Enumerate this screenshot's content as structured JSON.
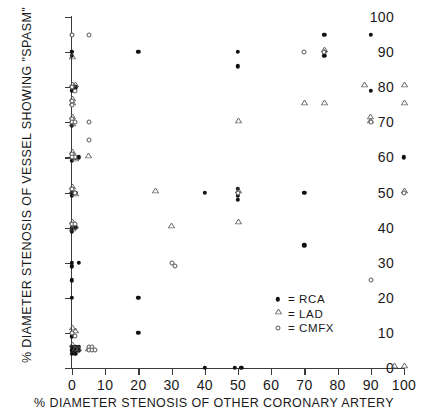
{
  "chart_data": {
    "type": "scatter",
    "title": "",
    "xlabel": "% DIAMETER STENOSIS OF OTHER CORONARY ARTERY",
    "ylabel": "% DIAMETER STENOSIS OF VESSEL SHOWING \"SPASM\"",
    "xlim": [
      0,
      100
    ],
    "ylim": [
      0,
      100
    ],
    "xticks": [
      0,
      10,
      20,
      30,
      40,
      50,
      60,
      70,
      80,
      90,
      100
    ],
    "yticks": [
      0,
      10,
      20,
      30,
      40,
      50,
      60,
      70,
      80,
      90,
      100
    ],
    "grid": false,
    "legend_position": "lower-right",
    "series": [
      {
        "name": "RCA",
        "marker": "filled-circle",
        "color": "#101010",
        "points": [
          [
            0,
            95
          ],
          [
            0,
            90
          ],
          [
            0,
            90
          ],
          [
            0,
            89
          ],
          [
            0,
            80
          ],
          [
            1,
            80
          ],
          [
            0,
            79
          ],
          [
            0,
            70
          ],
          [
            0,
            69
          ],
          [
            0,
            61
          ],
          [
            1,
            60
          ],
          [
            0,
            59
          ],
          [
            2,
            60
          ],
          [
            0,
            51
          ],
          [
            0,
            50
          ],
          [
            1,
            50
          ],
          [
            0,
            49
          ],
          [
            0,
            41
          ],
          [
            1,
            40
          ],
          [
            0,
            40
          ],
          [
            0,
            39
          ],
          [
            0,
            30
          ],
          [
            2,
            30
          ],
          [
            0,
            29
          ],
          [
            0,
            25
          ],
          [
            0,
            20
          ],
          [
            0,
            10
          ],
          [
            0,
            9
          ],
          [
            0,
            6
          ],
          [
            1,
            6
          ],
          [
            2,
            6
          ],
          [
            0,
            5
          ],
          [
            1,
            5
          ],
          [
            2,
            5
          ],
          [
            1,
            4
          ],
          [
            0,
            4
          ],
          [
            20,
            90
          ],
          [
            20,
            20
          ],
          [
            20,
            10
          ],
          [
            50,
            90
          ],
          [
            50,
            86
          ],
          [
            50,
            51
          ],
          [
            50,
            50
          ],
          [
            50,
            49
          ],
          [
            50,
            48
          ],
          [
            40,
            50
          ],
          [
            40,
            0
          ],
          [
            49,
            0
          ],
          [
            51,
            0
          ],
          [
            70,
            35
          ],
          [
            70,
            50
          ],
          [
            76,
            95
          ],
          [
            76,
            90
          ],
          [
            76,
            89
          ],
          [
            90,
            95
          ],
          [
            90,
            79
          ],
          [
            100,
            60
          ]
        ]
      },
      {
        "name": "LAD",
        "marker": "open-triangle",
        "color": "#555555",
        "points": [
          [
            0,
            88
          ],
          [
            0,
            80
          ],
          [
            1,
            80
          ],
          [
            0,
            76
          ],
          [
            0,
            75
          ],
          [
            0,
            71
          ],
          [
            0,
            70
          ],
          [
            0,
            69
          ],
          [
            0,
            61
          ],
          [
            0,
            60
          ],
          [
            1,
            59
          ],
          [
            5,
            60
          ],
          [
            0,
            51
          ],
          [
            0,
            50
          ],
          [
            1,
            49
          ],
          [
            0,
            41
          ],
          [
            1,
            40
          ],
          [
            0,
            39
          ],
          [
            0,
            11
          ],
          [
            1,
            10
          ],
          [
            0,
            6
          ],
          [
            1,
            5
          ],
          [
            2,
            5
          ],
          [
            5,
            5
          ],
          [
            6,
            5
          ],
          [
            25,
            50
          ],
          [
            30,
            40
          ],
          [
            50,
            70
          ],
          [
            50,
            41
          ],
          [
            50,
            50
          ],
          [
            70,
            75
          ],
          [
            76,
            75
          ],
          [
            76,
            90
          ],
          [
            88,
            80
          ],
          [
            90,
            70
          ],
          [
            90,
            71
          ],
          [
            100,
            80
          ],
          [
            100,
            75
          ],
          [
            100,
            50
          ],
          [
            100,
            0
          ],
          [
            97,
            0
          ]
        ]
      },
      {
        "name": "CMFX",
        "marker": "open-circle",
        "color": "#555555",
        "points": [
          [
            5,
            95
          ],
          [
            0,
            95
          ],
          [
            0,
            80
          ],
          [
            1,
            79
          ],
          [
            0,
            76
          ],
          [
            0,
            75
          ],
          [
            0,
            71
          ],
          [
            0,
            70
          ],
          [
            1,
            70
          ],
          [
            5,
            70
          ],
          [
            5,
            65
          ],
          [
            0,
            61
          ],
          [
            1,
            60
          ],
          [
            0,
            60
          ],
          [
            0,
            51
          ],
          [
            1,
            50
          ],
          [
            0,
            41
          ],
          [
            1,
            41
          ],
          [
            0,
            10
          ],
          [
            1,
            9
          ],
          [
            5,
            6
          ],
          [
            6,
            6
          ],
          [
            5,
            5
          ],
          [
            6,
            5
          ],
          [
            7,
            5
          ],
          [
            30,
            30
          ],
          [
            31,
            29
          ],
          [
            50,
            50
          ],
          [
            70,
            90
          ],
          [
            76,
            90
          ],
          [
            90,
            70
          ],
          [
            90,
            25
          ],
          [
            100,
            50
          ]
        ]
      }
    ]
  },
  "legend": {
    "items": [
      {
        "symbol": "filled-circle",
        "label": "= RCA"
      },
      {
        "symbol": "open-triangle",
        "label": "= LAD"
      },
      {
        "symbol": "open-circle",
        "label": "= CMFX"
      }
    ]
  }
}
